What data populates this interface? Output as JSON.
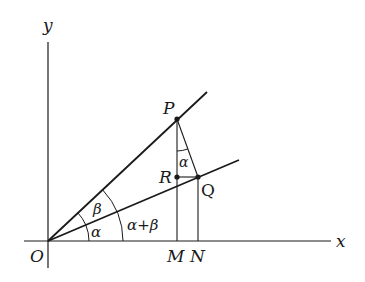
{
  "diagram": {
    "type": "geometry",
    "axes": {
      "x_label": "x",
      "y_label": "y"
    },
    "points": {
      "O": {
        "label": "O",
        "x": 48,
        "y": 241
      },
      "P": {
        "label": "P",
        "x": 177,
        "y": 119
      },
      "Q": {
        "label": "Q",
        "x": 198,
        "y": 177
      },
      "R": {
        "label": "R",
        "x": 177,
        "y": 177
      },
      "M": {
        "label": "M",
        "x": 177,
        "y": 241
      },
      "N": {
        "label": "N",
        "x": 198,
        "y": 241
      }
    },
    "angles": {
      "alpha_at_O": "α",
      "beta_at_O": "β",
      "sum_at_O": "α+β",
      "alpha_at_P": "α"
    },
    "segments": [
      "OP",
      "OQ",
      "PQ",
      "PM",
      "QN",
      "RQ"
    ],
    "colors": {
      "stroke": "#1a1a1a",
      "background": "#ffffff"
    }
  }
}
